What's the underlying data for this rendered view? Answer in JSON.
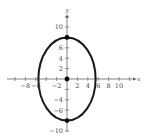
{
  "chart_data": {
    "type": "scatter",
    "title": "",
    "xlabel": "x",
    "ylabel": "y",
    "xlim": [
      -10,
      12
    ],
    "ylim": [
      -11,
      12
    ],
    "grid": false,
    "x_ticks": [
      -8,
      -6,
      -2,
      2,
      4,
      6,
      8,
      10
    ],
    "y_ticks": [
      10,
      6,
      4,
      2,
      -4,
      -6,
      -10
    ],
    "x_tick_labels": [
      "−8",
      "−6",
      "−2",
      "2",
      "4",
      "6",
      "8",
      "10"
    ],
    "y_tick_labels": [
      "10",
      "6",
      "4",
      "2",
      "−4",
      "−6",
      "−10"
    ],
    "ellipse": {
      "center": [
        0,
        0
      ],
      "semi_axis_x": 5.5,
      "semi_axis_y": 8
    },
    "points": [
      {
        "label": "center",
        "x": 0,
        "y": 0
      },
      {
        "label": "vertex-top",
        "x": 0,
        "y": 8
      },
      {
        "label": "vertex-bottom",
        "x": 0,
        "y": -8
      }
    ],
    "colors": {
      "curve": "#1a1a1a",
      "axes": "#666666",
      "points": "#000000"
    }
  },
  "axes": {
    "x_label": "x",
    "y_label": "y"
  }
}
